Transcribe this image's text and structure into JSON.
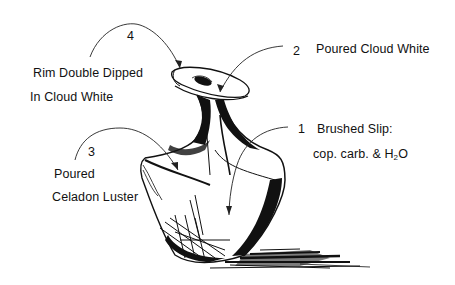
{
  "diagram": {
    "annotations": [
      {
        "number": "1",
        "lines": [
          "Brushed Slip:",
          "cop. carb. & H",
          "O"
        ],
        "subscript": "2",
        "target": "body-right"
      },
      {
        "number": "2",
        "lines": [
          "Poured Cloud White"
        ],
        "target": "rim-interior"
      },
      {
        "number": "3",
        "lines": [
          "Poured",
          "Celadon Luster"
        ],
        "target": "shoulder-left"
      },
      {
        "number": "4",
        "lines": [
          "Rim Double Dipped",
          "In Cloud White"
        ],
        "target": "rim-edge"
      }
    ],
    "colors": {
      "ink": "#111111",
      "background": "#ffffff"
    }
  }
}
